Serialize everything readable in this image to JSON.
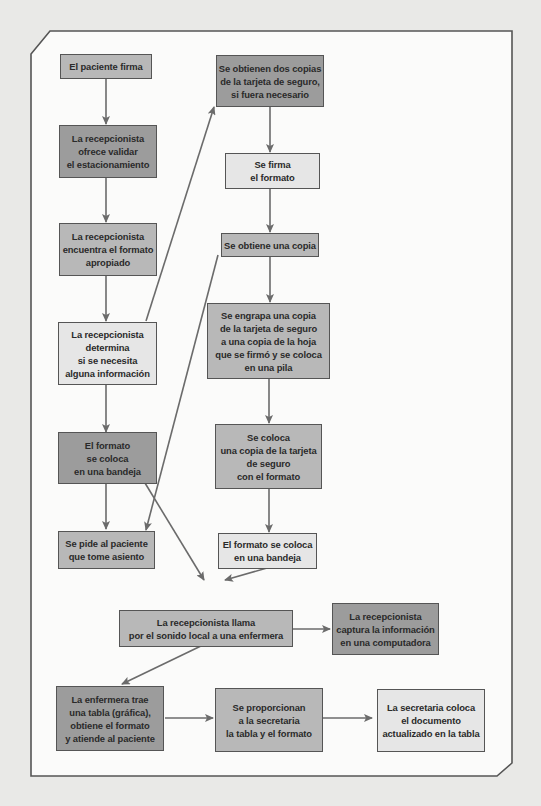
{
  "diagram": {
    "type": "flowchart",
    "colors": {
      "page_bg": "#e9e9e7",
      "frame_bg": "#fbfbfa",
      "frame_stroke": "#555555",
      "arrow": "#6b6b6b",
      "fill_dark": "#9c9c9c",
      "fill_mid": "#b8b8b8",
      "fill_light": "#e6e6e6"
    },
    "nodes": [
      {
        "id": "n1",
        "text": "El paciente firma",
        "shade": "mid"
      },
      {
        "id": "n2",
        "text": "La recepcionista\nofrece validar\nel estacionamiento",
        "shade": "dark"
      },
      {
        "id": "n3",
        "text": "La recepcionista\nencuentra el formato\napropiado",
        "shade": "mid"
      },
      {
        "id": "n4",
        "text": "La recepcionista\ndetermina\nsi se necesita\nalguna información",
        "shade": "light"
      },
      {
        "id": "n5",
        "text": "El formato\nse coloca\nen una bandeja",
        "shade": "dark"
      },
      {
        "id": "n6",
        "text": "Se pide al paciente\nque tome asiento",
        "shade": "mid"
      },
      {
        "id": "n7",
        "text": "Se obtienen dos copias\nde la tarjeta de seguro,\nsi fuera necesario",
        "shade": "dark"
      },
      {
        "id": "n8",
        "text": "Se firma\nel formato",
        "shade": "light"
      },
      {
        "id": "n9",
        "text": "Se obtiene una copia",
        "shade": "mid"
      },
      {
        "id": "n10",
        "text": "Se engrapa una copia\nde la tarjeta de seguro\na una copia de la hoja\nque se firmó y se coloca\nen una pila",
        "shade": "mid"
      },
      {
        "id": "n11",
        "text": "Se coloca\nuna copia de la tarjeta\nde seguro\ncon el formato",
        "shade": "mid"
      },
      {
        "id": "n12",
        "text": "El formato se coloca\nen una bandeja",
        "shade": "light"
      },
      {
        "id": "n13",
        "text": "La recepcionista llama\npor el sonido local a una enfermera",
        "shade": "mid"
      },
      {
        "id": "n14",
        "text": "La recepcionista\ncaptura la información\nen una computadora",
        "shade": "dark"
      },
      {
        "id": "n15",
        "text": "La enfermera trae\nuna tabla (gráfica),\nobtiene el formato\ny atiende al paciente",
        "shade": "dark"
      },
      {
        "id": "n16",
        "text": "Se proporcionan\na la secretaria\nla tabla y el formato",
        "shade": "mid"
      },
      {
        "id": "n17",
        "text": "La secretaria coloca\nel documento\nactualizado en la tabla",
        "shade": "light"
      }
    ],
    "edges": [
      {
        "from": "n1",
        "to": "n2"
      },
      {
        "from": "n2",
        "to": "n3"
      },
      {
        "from": "n3",
        "to": "n4"
      },
      {
        "from": "n4",
        "to": "n5"
      },
      {
        "from": "n4",
        "to": "n7"
      },
      {
        "from": "n5",
        "to": "n6"
      },
      {
        "from": "n5",
        "to": "n13"
      },
      {
        "from": "n9",
        "to": "n6"
      },
      {
        "from": "n7",
        "to": "n8"
      },
      {
        "from": "n8",
        "to": "n9"
      },
      {
        "from": "n9",
        "to": "n10"
      },
      {
        "from": "n10",
        "to": "n11"
      },
      {
        "from": "n11",
        "to": "n12"
      },
      {
        "from": "n12",
        "to": "n13"
      },
      {
        "from": "n13",
        "to": "n14"
      },
      {
        "from": "n13",
        "to": "n15"
      },
      {
        "from": "n15",
        "to": "n16"
      },
      {
        "from": "n16",
        "to": "n17"
      }
    ]
  }
}
